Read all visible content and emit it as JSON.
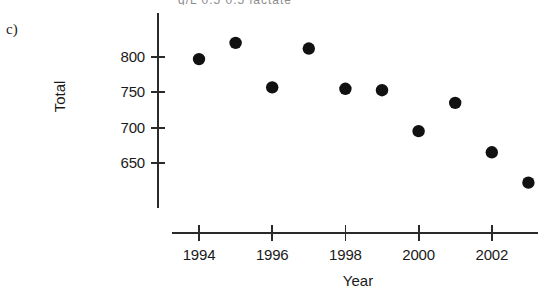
{
  "panel": {
    "label": "c)"
  },
  "top_caption_fragment": "g/L      0.5          0.5 lactate",
  "chart_data": {
    "type": "scatter",
    "title": "",
    "xlabel": "Year",
    "ylabel": "Total",
    "x": [
      1994,
      1995,
      1996,
      1997,
      1998,
      1999,
      2000,
      2001,
      2002,
      2003
    ],
    "values": [
      797,
      820,
      757,
      812,
      755,
      753,
      695,
      735,
      665,
      622
    ],
    "series": [
      {
        "name": "Total",
        "x": [
          1994,
          1995,
          1996,
          1997,
          1998,
          1999,
          2000,
          2001,
          2002,
          2003
        ],
        "values": [
          797,
          820,
          757,
          812,
          755,
          753,
          695,
          735,
          665,
          622
        ]
      }
    ],
    "xlim": [
      1993.2,
      2003.6
    ],
    "ylim": [
      613,
      838
    ],
    "xticks": [
      1994,
      1996,
      1998,
      2000,
      2002
    ],
    "xtick_labels": [
      "1994",
      "1996",
      "1998",
      "2000",
      "2002"
    ],
    "yticks": [
      650,
      700,
      750,
      800
    ],
    "ytick_labels": [
      "650",
      "700",
      "750",
      "800"
    ],
    "grid": false,
    "legend": false,
    "marker": "filled-circle",
    "marker_color": "#111111",
    "axis_color": "#2a2a2a",
    "background": "#ffffff"
  }
}
